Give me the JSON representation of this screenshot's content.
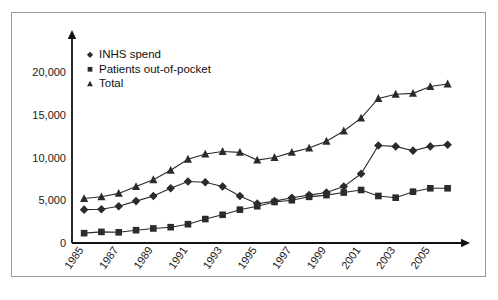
{
  "chart_data": {
    "type": "line",
    "title": "",
    "subtitle": "",
    "xlabel": "",
    "ylabel": "",
    "x": [
      1985,
      1986,
      1987,
      1988,
      1989,
      1990,
      1991,
      1992,
      1993,
      1994,
      1995,
      1996,
      1997,
      1998,
      1999,
      2000,
      2001,
      2002,
      2003,
      2004,
      2005,
      2006
    ],
    "xticklabels": [
      "1985",
      "1987",
      "1989",
      "1991",
      "1993",
      "1995",
      "1997",
      "1999",
      "2001",
      "2003",
      "2005"
    ],
    "xtickvalues": [
      1985,
      1987,
      1989,
      1991,
      1993,
      1995,
      1997,
      1999,
      2001,
      2003,
      2005
    ],
    "yticklabels": [
      "0",
      "5,000",
      "10,000",
      "15,000",
      "20,000"
    ],
    "ytickvalues": [
      0,
      5000,
      10000,
      15000,
      20000
    ],
    "ylim": [
      0,
      21500
    ],
    "xlim": [
      1984.3,
      2006.6
    ],
    "grid": false,
    "legend_position": "upper-left-inside",
    "series": [
      {
        "name": "INHS spend",
        "marker": "diamond",
        "values": [
          3900,
          3950,
          4300,
          4900,
          5500,
          6400,
          7200,
          7100,
          6600,
          5500,
          4600,
          4900,
          5300,
          5600,
          5900,
          6600,
          8100,
          11400,
          11300,
          10800,
          11300,
          11500
        ]
      },
      {
        "name": "Patients out-of-pocket",
        "marker": "square",
        "values": [
          1150,
          1300,
          1250,
          1500,
          1700,
          1850,
          2200,
          2800,
          3300,
          3900,
          4300,
          4800,
          5000,
          5400,
          5600,
          5900,
          6200,
          5500,
          5300,
          6000,
          6400,
          6400
        ]
      },
      {
        "name": "Total",
        "marker": "triangle",
        "values": [
          5200,
          5400,
          5800,
          6600,
          7400,
          8500,
          9800,
          10400,
          10700,
          10600,
          9700,
          10000,
          10600,
          11100,
          11900,
          13100,
          14600,
          16900,
          17400,
          17500,
          18300,
          18600
        ]
      }
    ]
  },
  "legend": {
    "items": [
      {
        "label": "INHS spend",
        "marker": "diamond"
      },
      {
        "label": "Patients out-of-pocket",
        "marker": "square"
      },
      {
        "label": "Total",
        "marker": "triangle"
      }
    ]
  }
}
